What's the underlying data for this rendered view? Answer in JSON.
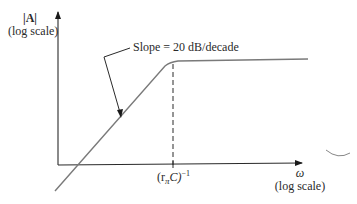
{
  "diagram": {
    "type": "bode-magnitude-asymptotic-plot",
    "y_axis": {
      "label": "|A|",
      "sublabel": "(log scale)"
    },
    "x_axis": {
      "label": "ω",
      "sublabel": "(log scale)"
    },
    "annotation": {
      "text": "Slope = 20 dB/decade"
    },
    "break_point": {
      "label_base": "(r",
      "label_sub": "π",
      "label_mid": "C)",
      "label_sup": "−1"
    },
    "colors": {
      "axis": "#2a2a2a",
      "curve": "#7a7a7a",
      "text": "#2a2a2a"
    }
  }
}
